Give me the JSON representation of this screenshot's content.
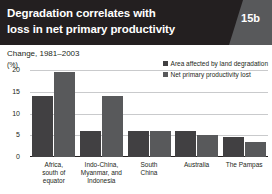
{
  "header": {
    "title_line1": "Degradation correlates with",
    "title_line2": "loss in net primary productivity",
    "figure_number": "15b"
  },
  "subtitle": "Change, 1981–2003",
  "axis": {
    "unit": "(%)",
    "yticks": [
      "20",
      "15",
      "10",
      "5",
      "0"
    ]
  },
  "legend": {
    "items": [
      {
        "label": "Area affected by land degradation",
        "color": "#414042"
      },
      {
        "label": "Net primary productivity lost",
        "color": "#58595b"
      }
    ]
  },
  "chart_data": {
    "type": "bar",
    "title": "Degradation correlates with loss in net primary productivity",
    "subtitle": "Change, 1981–2003",
    "xlabel": "",
    "ylabel": "(%)",
    "ylim": [
      0,
      20
    ],
    "yticks": [
      0,
      5,
      10,
      15,
      20
    ],
    "grid": true,
    "legend_position": "top-right",
    "categories": [
      "Africa, south of equator",
      "Indo-China, Myanmar, and Indonesia",
      "South China",
      "Australia",
      "The Pampas"
    ],
    "category_lines": [
      [
        "Africa,",
        "south of",
        "equator"
      ],
      [
        "Indo-China,",
        "Myanmar, and",
        "Indonesia"
      ],
      [
        "South",
        "China"
      ],
      [
        "Australia"
      ],
      [
        "The Pampas"
      ]
    ],
    "series": [
      {
        "name": "Area affected by land degradation",
        "color": "#414042",
        "values": [
          14,
          6,
          6,
          6,
          4.5
        ]
      },
      {
        "name": "Net primary productivity lost",
        "color": "#58595b",
        "values": [
          19.5,
          14,
          6,
          5,
          3.5
        ]
      }
    ]
  }
}
